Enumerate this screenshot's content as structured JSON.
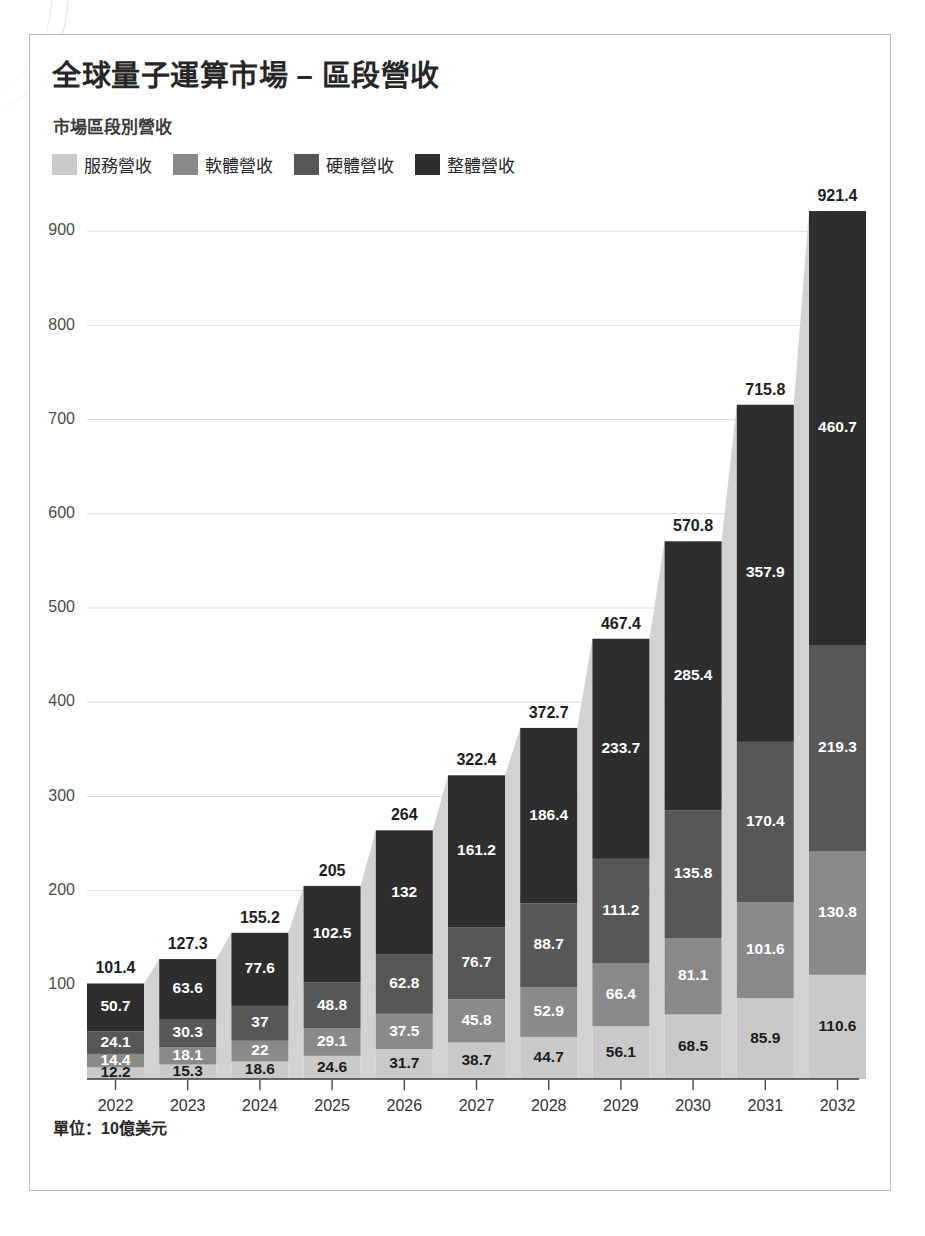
{
  "header": {
    "title": "全球量子運算市場 – 區段營收",
    "subtitle": "市場區段別營收"
  },
  "footnote": "單位：10億美元",
  "legend": [
    {
      "label": "服務營收",
      "color": "#c9c9c9"
    },
    {
      "label": "軟體營收",
      "color": "#8a8a8a"
    },
    {
      "label": "硬體營收",
      "color": "#575757"
    },
    {
      "label": "整體營收",
      "color": "#2e2e2e"
    }
  ],
  "colors": {
    "services": "#c9c9c9",
    "software": "#8a8a8a",
    "hardware": "#575757",
    "overall": "#2e2e2e",
    "ribbon": "#d2d2d2",
    "gridline": "#dcdcdc",
    "axis": "#4a4a4a",
    "label_dark": "#1d1d1d",
    "label_light": "#ffffff"
  },
  "chart_data": {
    "type": "bar",
    "stacked": true,
    "title": "全球量子運算市場 – 區段營收",
    "subtitle": "市場區段別營收",
    "xlabel": "",
    "ylabel": "",
    "unit_note": "單位：10億美元",
    "ylim": [
      0,
      960
    ],
    "yticks": [
      100,
      200,
      300,
      400,
      500,
      600,
      700,
      800,
      900
    ],
    "grid": true,
    "legend_position": "top-left",
    "categories": [
      "2022",
      "2023",
      "2024",
      "2025",
      "2026",
      "2027",
      "2028",
      "2029",
      "2030",
      "2031",
      "2032"
    ],
    "series": [
      {
        "name": "服務營收",
        "color": "#c9c9c9",
        "values": [
          12.2,
          15.3,
          18.6,
          24.6,
          31.7,
          38.7,
          44.7,
          56.1,
          68.5,
          85.9,
          110.6
        ]
      },
      {
        "name": "軟體營收",
        "color": "#8a8a8a",
        "values": [
          14.4,
          18.1,
          22,
          29.1,
          37.5,
          45.8,
          52.9,
          66.4,
          81.1,
          101.6,
          130.8
        ]
      },
      {
        "name": "硬體營收",
        "color": "#575757",
        "values": [
          24.1,
          30.3,
          37,
          48.8,
          62.8,
          76.7,
          88.7,
          111.2,
          135.8,
          170.4,
          219.3
        ]
      },
      {
        "name": "整體營收",
        "color": "#2e2e2e",
        "values": [
          50.7,
          63.6,
          77.6,
          102.5,
          132,
          161.2,
          186.4,
          233.7,
          285.4,
          357.9,
          460.7
        ]
      }
    ],
    "segment_labels": [
      [
        "12.2",
        "14.4",
        "24.1",
        "50.7"
      ],
      [
        "15.3",
        "18.1",
        "30.3",
        "63.6"
      ],
      [
        "18.6",
        "22",
        "37",
        "77.6"
      ],
      [
        "24.6",
        "29.1",
        "48.8",
        "102.5"
      ],
      [
        "31.7",
        "37.5",
        "62.8",
        "132"
      ],
      [
        "38.7",
        "45.8",
        "76.7",
        "161.2"
      ],
      [
        "44.7",
        "52.9",
        "88.7",
        "186.4"
      ],
      [
        "56.1",
        "66.4",
        "111.2",
        "233.7"
      ],
      [
        "68.5",
        "81.1",
        "135.8",
        "285.4"
      ],
      [
        "85.9",
        "101.6",
        "170.4",
        "357.9"
      ],
      [
        "110.6",
        "130.8",
        "219.3",
        "460.7"
      ]
    ],
    "totals": [
      101.4,
      127.3,
      155.2,
      205,
      264,
      322.4,
      372.7,
      467.4,
      570.8,
      715.8,
      921.4
    ],
    "total_labels": [
      "101.4",
      "127.3",
      "155.2",
      "205",
      "264",
      "322.4",
      "372.7",
      "467.4",
      "570.8",
      "715.8",
      "921.4"
    ]
  }
}
